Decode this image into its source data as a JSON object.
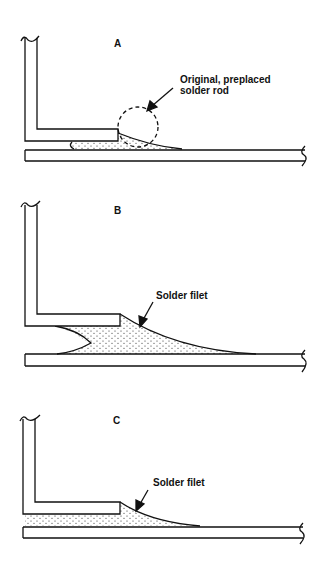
{
  "figure": {
    "panels": [
      {
        "id": "A",
        "letter": "A",
        "callout": {
          "line1": "Original, preplaced",
          "line2": "solder rod"
        }
      },
      {
        "id": "B",
        "letter": "B",
        "callout": {
          "line1": "Solder filet"
        }
      },
      {
        "id": "C",
        "letter": "C",
        "callout": {
          "line1": "Solder filet"
        }
      }
    ],
    "colors": {
      "ink": "#111111",
      "background": "#ffffff"
    }
  }
}
